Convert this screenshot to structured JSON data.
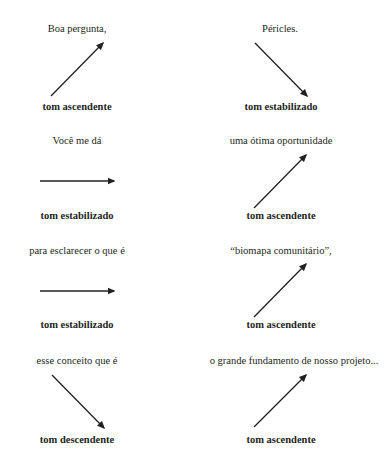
{
  "colors": {
    "text": "#231f20",
    "arrow": "#231f20",
    "background": "#ffffff"
  },
  "panels": [
    {
      "phrase": "Boa pergunta,",
      "tone": "tom ascendente",
      "direction": "rising"
    },
    {
      "phrase": "Péricles.",
      "tone": "tom descendente",
      "direction": "falling"
    },
    {
      "phrase": "Você me dá",
      "tone": "tom estabilizado",
      "direction": "level"
    },
    {
      "phrase": "uma ótima oportunidade",
      "tone": "tom ascendente",
      "direction": "rising"
    },
    {
      "phrase": "para esclarecer o que é",
      "tone": "tom estabilizado",
      "direction": "level"
    },
    {
      "phrase": "“biomapa comunitário”,",
      "tone": "tom ascendente",
      "direction": "rising"
    },
    {
      "phrase": "esse conceito que é",
      "tone": "tom descendente",
      "direction": "falling"
    },
    {
      "phrase": "o grande fundamento de nosso projeto...",
      "tone": "tom ascendente",
      "direction": "rising"
    }
  ]
}
